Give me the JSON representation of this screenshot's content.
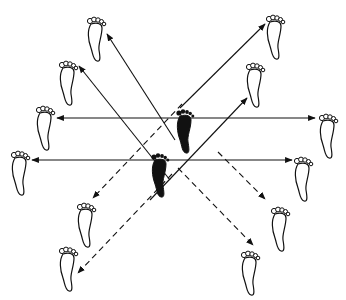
{
  "diagram": {
    "type": "footwork-directions",
    "colors": {
      "line": "#111111",
      "foot_fill_center": "#111111",
      "foot_outline": "#111111",
      "background": "#ffffff"
    },
    "center_feet": [
      {
        "id": "center-right-foot",
        "x": 185,
        "y": 130,
        "fill": "solid"
      },
      {
        "id": "center-left-foot",
        "x": 160,
        "y": 174,
        "fill": "solid"
      }
    ],
    "outline_feet": [
      {
        "id": "foot-top-left-far",
        "x": 96,
        "y": 38
      },
      {
        "id": "foot-top-left-near",
        "x": 68,
        "y": 82
      },
      {
        "id": "foot-left-upper",
        "x": 45,
        "y": 127
      },
      {
        "id": "foot-left-lower",
        "x": 20,
        "y": 172
      },
      {
        "id": "foot-bottom-left-near",
        "x": 86,
        "y": 224
      },
      {
        "id": "foot-bottom-left-far",
        "x": 68,
        "y": 268
      },
      {
        "id": "foot-top-right-far",
        "x": 275,
        "y": 36
      },
      {
        "id": "foot-top-right-near",
        "x": 255,
        "y": 84
      },
      {
        "id": "foot-right-upper",
        "x": 328,
        "y": 135
      },
      {
        "id": "foot-right-lower",
        "x": 303,
        "y": 178
      },
      {
        "id": "foot-bottom-right-near",
        "x": 280,
        "y": 228
      },
      {
        "id": "foot-bottom-right-far",
        "x": 250,
        "y": 272
      }
    ],
    "arrows": [
      {
        "id": "arrow-horizontal-upper",
        "x1": 57,
        "y1": 118,
        "x2": 315,
        "y2": 118,
        "style": "solid",
        "heads": "both"
      },
      {
        "id": "arrow-horizontal-lower",
        "x1": 32,
        "y1": 160,
        "x2": 292,
        "y2": 160,
        "style": "solid",
        "heads": "both"
      },
      {
        "id": "arrow-to-top-left-far",
        "x1": 175,
        "y1": 140,
        "x2": 107,
        "y2": 34,
        "style": "solid",
        "heads": "end"
      },
      {
        "id": "arrow-to-top-left-near",
        "x1": 170,
        "y1": 180,
        "x2": 79,
        "y2": 66,
        "style": "solid",
        "heads": "end"
      },
      {
        "id": "arrow-to-top-right-far",
        "x1": 180,
        "y1": 108,
        "x2": 265,
        "y2": 24,
        "style": "solid",
        "heads": "end"
      },
      {
        "id": "arrow-to-top-right-near",
        "x1": 150,
        "y1": 200,
        "x2": 247,
        "y2": 98,
        "style": "solid",
        "heads": "end"
      },
      {
        "id": "arrow-to-bottom-left-near",
        "x1": 182,
        "y1": 104,
        "x2": 93,
        "y2": 198,
        "style": "dashed",
        "heads": "end"
      },
      {
        "id": "arrow-to-bottom-left-far",
        "x1": 172,
        "y1": 174,
        "x2": 78,
        "y2": 273,
        "style": "dashed",
        "heads": "end"
      },
      {
        "id": "arrow-to-bottom-right-near",
        "x1": 218,
        "y1": 152,
        "x2": 265,
        "y2": 199,
        "style": "dashed",
        "heads": "end"
      },
      {
        "id": "arrow-to-bottom-right-far",
        "x1": 178,
        "y1": 168,
        "x2": 253,
        "y2": 245,
        "style": "dashed",
        "heads": "end"
      }
    ]
  }
}
